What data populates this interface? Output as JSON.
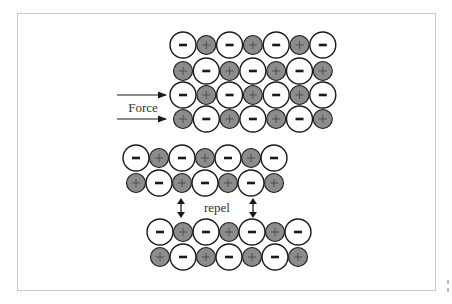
{
  "diagram": {
    "labels": {
      "force": "Force",
      "repel": "repel"
    },
    "symbols": {
      "anion": "−",
      "cation": "+"
    },
    "colors": {
      "anion_fill": "#ffffff",
      "cation_fill": "#8c8c8c",
      "stroke": "#1a1a1a",
      "frame": "#c8c8c8"
    },
    "blocks": [
      {
        "name": "top-lattice",
        "rows": [
          [
            "-",
            "+",
            "-",
            "+",
            "-",
            "+",
            "-"
          ],
          [
            "+",
            "-",
            "+",
            "-",
            "+",
            "-",
            "+"
          ],
          [
            "-",
            "+",
            "-",
            "+",
            "-",
            "+",
            "-"
          ],
          [
            "+",
            "-",
            "+",
            "-",
            "+",
            "-",
            "+"
          ]
        ]
      },
      {
        "name": "shifted-upper-layer",
        "rows": [
          [
            "-",
            "+",
            "-",
            "+",
            "-",
            "+",
            "-"
          ],
          [
            "+",
            "-",
            "+",
            "-",
            "+",
            "-",
            "+"
          ]
        ]
      },
      {
        "name": "shifted-lower-layer",
        "rows": [
          [
            "-",
            "+",
            "-",
            "+",
            "-",
            "+",
            "-"
          ],
          [
            "+",
            "-",
            "+",
            "-",
            "+",
            "-",
            "+"
          ]
        ]
      }
    ]
  }
}
